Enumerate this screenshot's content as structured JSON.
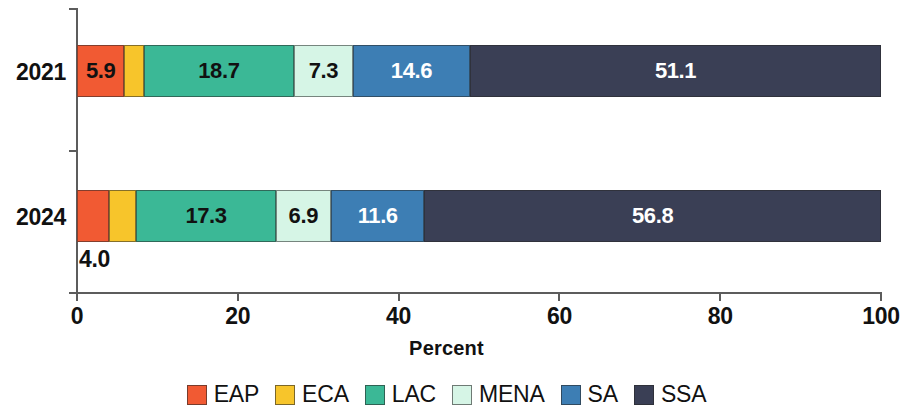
{
  "chart_data": {
    "type": "bar",
    "orientation": "horizontal",
    "stacked": true,
    "normalized_percent": true,
    "title": "",
    "subtitle": "",
    "xlabel": "Percent",
    "ylabel": "",
    "xlim": [
      0,
      100
    ],
    "xticks": [
      0,
      20,
      40,
      60,
      80,
      100
    ],
    "xtick_labels": [
      "0",
      "20",
      "40",
      "60",
      "80",
      "100"
    ],
    "grid": false,
    "legend_position": "bottom",
    "categories": [
      "2021",
      "2024"
    ],
    "series": [
      {
        "name": "EAP",
        "color": "#F15A33",
        "values": [
          5.9,
          4.0
        ],
        "labels": [
          "5.9",
          "4.0"
        ],
        "label_color": [
          "dark",
          "dark"
        ],
        "label_placement": [
          "inside",
          "outside-below"
        ]
      },
      {
        "name": "ECA",
        "color": "#F7C52B",
        "values": [
          2.4,
          3.4
        ],
        "labels": [
          "",
          ""
        ],
        "label_color": [
          "dark",
          "dark"
        ],
        "label_placement": [
          "none",
          "none"
        ]
      },
      {
        "name": "LAC",
        "color": "#3BB896",
        "values": [
          18.7,
          17.3
        ],
        "labels": [
          "18.7",
          "17.3"
        ],
        "label_color": [
          "dark",
          "dark"
        ],
        "label_placement": [
          "inside",
          "inside"
        ]
      },
      {
        "name": "MENA",
        "color": "#D6F5E6",
        "values": [
          7.3,
          6.9
        ],
        "labels": [
          "7.3",
          "6.9"
        ],
        "label_color": [
          "dark",
          "dark"
        ],
        "label_placement": [
          "inside",
          "inside"
        ]
      },
      {
        "name": "SA",
        "color": "#3D7EB4",
        "values": [
          14.6,
          11.6
        ],
        "labels": [
          "14.6",
          "11.6"
        ],
        "label_color": [
          "light",
          "light"
        ],
        "label_placement": [
          "inside",
          "inside"
        ]
      },
      {
        "name": "SSA",
        "color": "#3A3F55",
        "values": [
          51.1,
          56.8
        ],
        "labels": [
          "51.1",
          "56.8"
        ],
        "label_color": [
          "light",
          "light"
        ],
        "label_placement": [
          "inside",
          "inside"
        ]
      }
    ]
  },
  "axis": {
    "x_label": "Percent",
    "x_ticks": [
      "0",
      "20",
      "40",
      "60",
      "80",
      "100"
    ],
    "y_categories": [
      "2021",
      "2024"
    ]
  },
  "bars": {
    "b2021": {
      "category": "2021",
      "eap": {
        "label": "5.9",
        "value": 5.9
      },
      "eca": {
        "label": "",
        "value": 2.4
      },
      "lac": {
        "label": "18.7",
        "value": 18.7
      },
      "mena": {
        "label": "7.3",
        "value": 7.3
      },
      "sa": {
        "label": "14.6",
        "value": 14.6
      },
      "ssa": {
        "label": "51.1",
        "value": 51.1
      }
    },
    "b2024": {
      "category": "2024",
      "eap": {
        "label": "4.0",
        "value": 4.0
      },
      "eca": {
        "label": "",
        "value": 3.4
      },
      "lac": {
        "label": "17.3",
        "value": 17.3
      },
      "mena": {
        "label": "6.9",
        "value": 6.9
      },
      "sa": {
        "label": "11.6",
        "value": 11.6
      },
      "ssa": {
        "label": "56.8",
        "value": 56.8
      }
    }
  },
  "legend": {
    "items": [
      {
        "label": "EAP",
        "color": "#F15A33"
      },
      {
        "label": "ECA",
        "color": "#F7C52B"
      },
      {
        "label": "LAC",
        "color": "#3BB896"
      },
      {
        "label": "MENA",
        "color": "#D6F5E6"
      },
      {
        "label": "SA",
        "color": "#3D7EB4"
      },
      {
        "label": "SSA",
        "color": "#3A3F55"
      }
    ]
  }
}
